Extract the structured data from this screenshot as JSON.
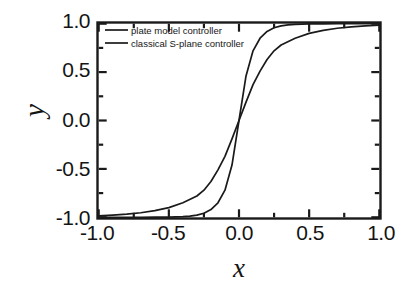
{
  "chart_data": {
    "type": "line",
    "title": "",
    "xlabel": "x",
    "ylabel": "y",
    "xlim": [
      -1.0,
      1.0
    ],
    "ylim": [
      -1.0,
      1.0
    ],
    "xticks": [
      "-1.0",
      "-0.5",
      "0.0",
      "0.5",
      "1.0"
    ],
    "xtick_values": [
      -1.0,
      -0.5,
      0.0,
      0.5,
      1.0
    ],
    "yticks": [
      "1.0",
      "0.5",
      "0.0",
      "-0.5",
      "-1.0"
    ],
    "ytick_values": [
      1.0,
      0.5,
      0.0,
      -0.5,
      -1.0
    ],
    "minor_tick_step": 0.25,
    "grid": false,
    "legend_position": "upper-left",
    "line_color": "#1a1a1a",
    "frame_color": "#1a1a1a",
    "background_color": "#ffffff",
    "series": [
      {
        "name": "plate model controller",
        "x": [
          -1.0,
          -0.9,
          -0.8,
          -0.7,
          -0.6,
          -0.5,
          -0.45,
          -0.4,
          -0.35,
          -0.3,
          -0.25,
          -0.2,
          -0.15,
          -0.1,
          -0.05,
          0.0,
          0.05,
          0.1,
          0.15,
          0.2,
          0.25,
          0.3,
          0.35,
          0.4,
          0.45,
          0.5,
          0.6,
          0.7,
          0.8,
          0.9,
          1.0
        ],
        "values": [
          -1.0,
          -1.0,
          -1.0,
          -1.0,
          -0.999,
          -0.998,
          -0.996,
          -0.993,
          -0.988,
          -0.978,
          -0.958,
          -0.92,
          -0.85,
          -0.72,
          -0.46,
          0.0,
          0.46,
          0.72,
          0.85,
          0.92,
          0.958,
          0.978,
          0.988,
          0.993,
          0.996,
          0.998,
          0.999,
          1.0,
          1.0,
          1.0,
          1.0
        ]
      },
      {
        "name": "classical S-plane controller",
        "x": [
          -1.0,
          -0.9,
          -0.8,
          -0.7,
          -0.6,
          -0.5,
          -0.4,
          -0.3,
          -0.25,
          -0.2,
          -0.15,
          -0.1,
          -0.05,
          0.0,
          0.05,
          0.1,
          0.15,
          0.2,
          0.25,
          0.3,
          0.4,
          0.5,
          0.6,
          0.7,
          0.8,
          0.9,
          1.0
        ],
        "values": [
          -0.985,
          -0.978,
          -0.968,
          -0.953,
          -0.931,
          -0.9,
          -0.85,
          -0.78,
          -0.72,
          -0.63,
          -0.51,
          -0.37,
          -0.19,
          0.0,
          0.19,
          0.37,
          0.51,
          0.63,
          0.72,
          0.78,
          0.85,
          0.9,
          0.931,
          0.953,
          0.968,
          0.978,
          0.985
        ]
      }
    ]
  },
  "legend": {
    "entries": [
      {
        "label": "plate model controller"
      },
      {
        "label": "classical S-plane controller"
      }
    ]
  },
  "axes": {
    "x_label": "x",
    "y_label": "y"
  }
}
